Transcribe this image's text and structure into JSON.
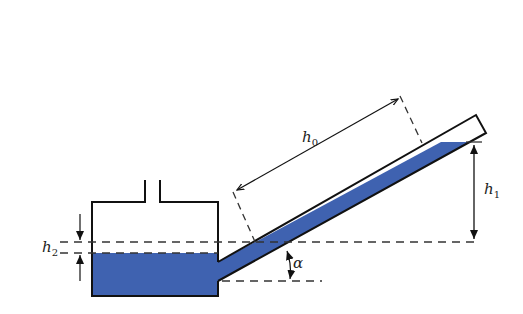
{
  "diagram": {
    "type": "inclined-tube micromanometer",
    "labels": {
      "h0": {
        "base": "h",
        "sub": "0"
      },
      "h1": {
        "base": "h",
        "sub": "1"
      },
      "h2": {
        "base": "h",
        "sub": "2"
      },
      "alpha": "α"
    },
    "colors": {
      "liquid": "#3f62b0",
      "outline": "#111111",
      "dash": "#333333",
      "background": "#ffffff"
    }
  }
}
